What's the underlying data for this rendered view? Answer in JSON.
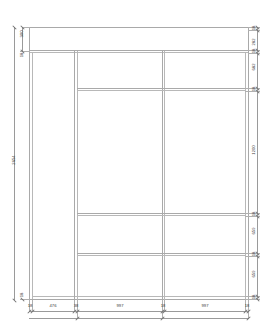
{
  "drawing": {
    "type": "cabinet-elevation",
    "title": "Wardrobe front elevation",
    "units": "mm",
    "line_color": "#a9a9a9",
    "text_color": "#3a3a3a",
    "overall": {
      "height": "2654",
      "top_band_outer": "300"
    },
    "dimensions_left": [
      {
        "id": "left-300",
        "label": "300"
      },
      {
        "id": "left-18",
        "label": "18"
      },
      {
        "id": "left-2654",
        "label": "2654"
      },
      {
        "id": "left-18b",
        "label": "18"
      }
    ],
    "dimensions_right": [
      {
        "id": "right-18-top",
        "label": "18"
      },
      {
        "id": "right-282",
        "label": "282"
      },
      {
        "id": "right-18-a",
        "label": "18"
      },
      {
        "id": "right-682",
        "label": "682"
      },
      {
        "id": "right-18-b",
        "label": "18"
      },
      {
        "id": "right-1200",
        "label": "1200"
      },
      {
        "id": "right-18-c",
        "label": "18"
      },
      {
        "id": "right-659-a",
        "label": "659"
      },
      {
        "id": "right-18-d",
        "label": "18"
      },
      {
        "id": "right-659-b",
        "label": "659"
      },
      {
        "id": "right-18-e",
        "label": "18"
      }
    ],
    "dimensions_bottom": [
      {
        "id": "bot-18-a",
        "label": "18"
      },
      {
        "id": "bot-476",
        "label": "476"
      },
      {
        "id": "bot-38",
        "label": "38"
      },
      {
        "id": "bot-997-a",
        "label": "997"
      },
      {
        "id": "bot-18-b",
        "label": "18"
      },
      {
        "id": "bot-997-b",
        "label": "997"
      },
      {
        "id": "bot-18-c",
        "label": "18"
      }
    ]
  }
}
